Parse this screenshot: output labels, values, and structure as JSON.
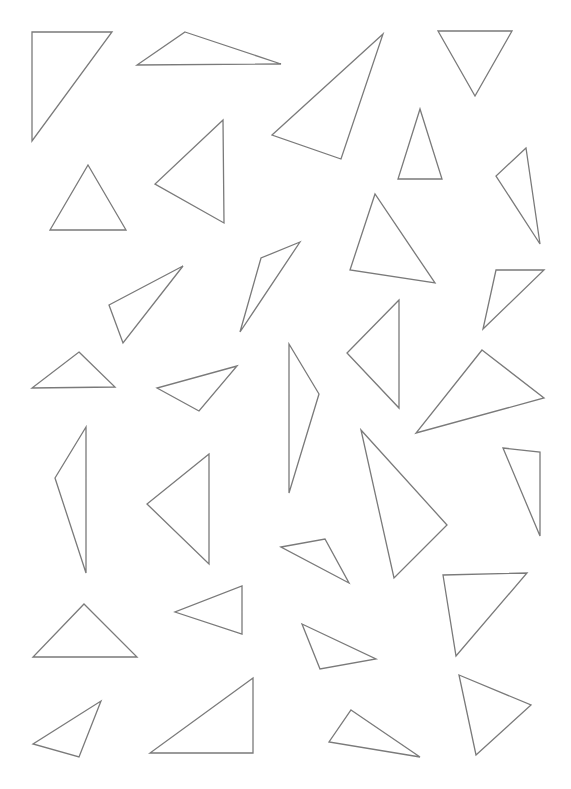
{
  "canvas": {
    "width": 571,
    "height": 789,
    "background": "#ffffff",
    "stroke": "#7a7a7a"
  },
  "triangles": [
    [
      [
        32,
        32
      ],
      [
        112,
        32
      ],
      [
        32,
        141
      ]
    ],
    [
      [
        185,
        32
      ],
      [
        281,
        64
      ],
      [
        137,
        65
      ]
    ],
    [
      [
        383,
        34
      ],
      [
        272,
        135
      ],
      [
        341,
        159
      ]
    ],
    [
      [
        438,
        31
      ],
      [
        512,
        31
      ],
      [
        475,
        96
      ]
    ],
    [
      [
        223,
        120
      ],
      [
        224,
        223
      ],
      [
        155,
        184
      ]
    ],
    [
      [
        88,
        165
      ],
      [
        126,
        230
      ],
      [
        50,
        230
      ]
    ],
    [
      [
        420,
        109
      ],
      [
        398,
        179
      ],
      [
        442,
        179
      ]
    ],
    [
      [
        526,
        148
      ],
      [
        496,
        176
      ],
      [
        540,
        244
      ]
    ],
    [
      [
        375,
        194
      ],
      [
        350,
        270
      ],
      [
        435,
        283
      ]
    ],
    [
      [
        300,
        242
      ],
      [
        261,
        258
      ],
      [
        240,
        332
      ]
    ],
    [
      [
        183,
        266
      ],
      [
        109,
        305
      ],
      [
        123,
        343
      ]
    ],
    [
      [
        496,
        270
      ],
      [
        544,
        270
      ],
      [
        483,
        329
      ]
    ],
    [
      [
        399,
        300
      ],
      [
        347,
        353
      ],
      [
        399,
        408
      ]
    ],
    [
      [
        79,
        352
      ],
      [
        115,
        387
      ],
      [
        32,
        388
      ]
    ],
    [
      [
        237,
        366
      ],
      [
        157,
        388
      ],
      [
        199,
        411
      ]
    ],
    [
      [
        289,
        344
      ],
      [
        319,
        394
      ],
      [
        289,
        493
      ]
    ],
    [
      [
        482,
        350
      ],
      [
        544,
        398
      ],
      [
        416,
        433
      ]
    ],
    [
      [
        86,
        427
      ],
      [
        55,
        478
      ],
      [
        86,
        573
      ]
    ],
    [
      [
        361,
        430
      ],
      [
        447,
        525
      ],
      [
        394,
        578
      ]
    ],
    [
      [
        209,
        454
      ],
      [
        147,
        504
      ],
      [
        209,
        564
      ]
    ],
    [
      [
        503,
        448
      ],
      [
        540,
        452
      ],
      [
        540,
        536
      ]
    ],
    [
      [
        281,
        547
      ],
      [
        325,
        539
      ],
      [
        349,
        583
      ]
    ],
    [
      [
        443,
        575
      ],
      [
        527,
        573
      ],
      [
        456,
        656
      ]
    ],
    [
      [
        242,
        586
      ],
      [
        242,
        634
      ],
      [
        175,
        612
      ]
    ],
    [
      [
        84,
        604
      ],
      [
        137,
        657
      ],
      [
        33,
        657
      ]
    ],
    [
      [
        302,
        624
      ],
      [
        376,
        659
      ],
      [
        320,
        669
      ]
    ],
    [
      [
        101,
        701
      ],
      [
        79,
        757
      ],
      [
        33,
        744
      ]
    ],
    [
      [
        253,
        678
      ],
      [
        253,
        753
      ],
      [
        150,
        753
      ]
    ],
    [
      [
        351,
        710
      ],
      [
        420,
        757
      ],
      [
        329,
        742
      ]
    ],
    [
      [
        459,
        675
      ],
      [
        531,
        705
      ],
      [
        476,
        755
      ]
    ]
  ]
}
